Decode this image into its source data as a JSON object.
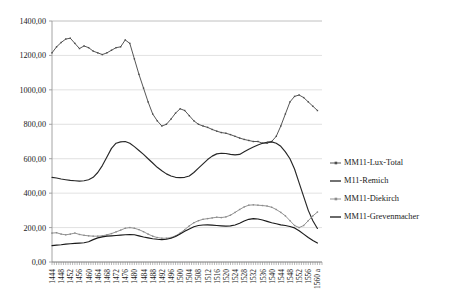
{
  "chart_data": {
    "type": "line",
    "title": "",
    "subtitle": "",
    "xlabel": "",
    "ylabel": "",
    "xlim": [
      1444,
      1562
    ],
    "ylim": [
      0,
      1400
    ],
    "grid": true,
    "legend_position": "right",
    "yticks": [
      0,
      200,
      400,
      600,
      800,
      1000,
      1200,
      1400
    ],
    "ytick_labels": [
      "0,00",
      "200,00",
      "400,00",
      "600,00",
      "800,00",
      "1000,00",
      "1200,00",
      "1400,00"
    ],
    "xticks": [
      1444,
      1448,
      1452,
      1456,
      1460,
      1464,
      1468,
      1472,
      1476,
      1480,
      1484,
      1488,
      1492,
      1496,
      1500,
      1504,
      1508,
      1512,
      1516,
      1520,
      1524,
      1528,
      1532,
      1536,
      1540,
      1544,
      1548,
      1552,
      1556,
      1560
    ],
    "xtick_labels": [
      "1444",
      "1448",
      "1452",
      "1456",
      "1460",
      "1464",
      "1468",
      "1472",
      "1476",
      "1480",
      "1484",
      "1488",
      "1492",
      "1496",
      "1500",
      "1504",
      "1508",
      "1512",
      "1516",
      "1520",
      "1524",
      "1528",
      "1532",
      "1536",
      "1540",
      "1544",
      "1548",
      "1552",
      "1556",
      "1560 a"
    ],
    "x": [
      1444,
      1446,
      1448,
      1450,
      1452,
      1454,
      1456,
      1458,
      1460,
      1462,
      1464,
      1466,
      1468,
      1470,
      1472,
      1474,
      1476,
      1478,
      1480,
      1482,
      1484,
      1486,
      1488,
      1490,
      1492,
      1494,
      1496,
      1498,
      1500,
      1502,
      1504,
      1506,
      1508,
      1510,
      1512,
      1514,
      1516,
      1518,
      1520,
      1522,
      1524,
      1526,
      1528,
      1530,
      1532,
      1534,
      1536,
      1538,
      1540,
      1542,
      1544,
      1546,
      1548,
      1550,
      1552,
      1554,
      1556,
      1558,
      1560
    ],
    "series": [
      {
        "name": "MM11-Lux-Total",
        "color": "#4d4d4d",
        "marker": true,
        "values": [
          1215,
          1250,
          1275,
          1295,
          1300,
          1270,
          1240,
          1255,
          1245,
          1225,
          1215,
          1205,
          1215,
          1230,
          1245,
          1250,
          1290,
          1270,
          1180,
          1090,
          1010,
          930,
          860,
          820,
          790,
          800,
          830,
          865,
          890,
          880,
          850,
          820,
          800,
          790,
          782,
          770,
          760,
          752,
          748,
          740,
          730,
          720,
          712,
          706,
          700,
          700,
          690,
          690,
          700,
          730,
          790,
          860,
          930,
          962,
          970,
          955,
          930,
          905,
          880
        ]
      },
      {
        "name": "M11-Remich",
        "color": "#262626",
        "marker": false,
        "values": [
          492,
          488,
          482,
          478,
          474,
          472,
          470,
          472,
          478,
          492,
          520,
          560,
          610,
          660,
          690,
          698,
          700,
          690,
          670,
          648,
          625,
          600,
          575,
          550,
          530,
          512,
          500,
          492,
          490,
          492,
          500,
          520,
          545,
          570,
          595,
          615,
          628,
          632,
          630,
          625,
          622,
          625,
          640,
          655,
          668,
          680,
          690,
          696,
          698,
          690,
          672,
          640,
          600,
          540,
          460,
          380,
          300,
          240,
          195
        ]
      },
      {
        "name": "MM11-Diekirch",
        "color": "#8c8c8c",
        "marker": true,
        "values": [
          168,
          170,
          162,
          158,
          162,
          168,
          160,
          155,
          152,
          150,
          150,
          152,
          158,
          165,
          175,
          185,
          196,
          200,
          196,
          188,
          176,
          162,
          150,
          142,
          138,
          138,
          142,
          152,
          168,
          188,
          210,
          228,
          240,
          248,
          252,
          256,
          260,
          258,
          262,
          272,
          288,
          305,
          320,
          330,
          332,
          330,
          328,
          325,
          318,
          305,
          288,
          268,
          240,
          212,
          200,
          212,
          240,
          268,
          290
        ]
      },
      {
        "name": "MM11-Grevenmacher",
        "color": "#1a1a1a",
        "marker": false,
        "values": [
          95,
          98,
          100,
          104,
          106,
          108,
          110,
          112,
          118,
          130,
          140,
          146,
          150,
          152,
          154,
          156,
          158,
          160,
          158,
          152,
          145,
          140,
          135,
          132,
          130,
          132,
          138,
          148,
          162,
          178,
          192,
          205,
          212,
          215,
          216,
          214,
          212,
          210,
          208,
          210,
          215,
          225,
          238,
          248,
          252,
          250,
          244,
          236,
          228,
          222,
          216,
          212,
          206,
          198,
          182,
          162,
          142,
          125,
          110
        ]
      }
    ]
  },
  "legend": {
    "items": [
      {
        "label": "MM11-Lux-Total"
      },
      {
        "label": "M11-Remich"
      },
      {
        "label": "MM11-Diekirch"
      },
      {
        "label": "MM11-Grevenmacher"
      }
    ]
  }
}
